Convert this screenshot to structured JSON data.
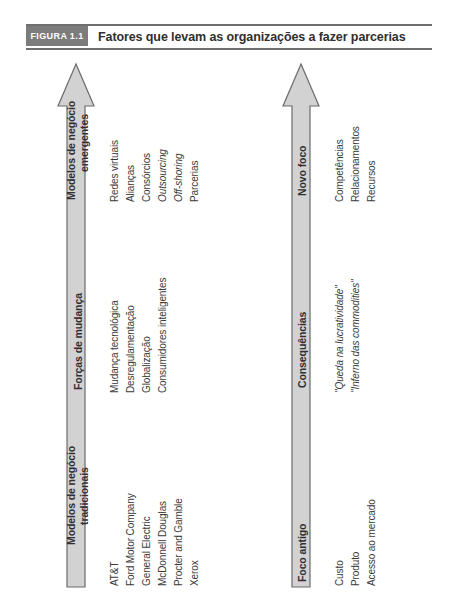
{
  "figure": {
    "badge": "FIGURA 1.1",
    "title": "Fatores que levam as organizações a fazer parcerias"
  },
  "colors": {
    "arrow_fill": "#d2d2d2",
    "arrow_stroke": "#6b6b6b",
    "badge_bg": "#7c7c7c",
    "rule": "#6f6f6f",
    "text": "#3a3a3a"
  },
  "left_arrow": {
    "name": "left-arrow",
    "bands": [
      {
        "label": "Modelos de negócio emergentes",
        "label_line1": "Modelos de negócio",
        "label_line2": "emergentes",
        "items": [
          {
            "text": "Redes virtuais",
            "italic": false
          },
          {
            "text": "Alianças",
            "italic": false
          },
          {
            "text": "Consórcios",
            "italic": false
          },
          {
            "text": "Outsourcing",
            "italic": true
          },
          {
            "text": "Off-shoring",
            "italic": true
          },
          {
            "text": "Parcerias",
            "italic": false
          }
        ]
      },
      {
        "label": "Forças de mudança",
        "label_line1": "Forças de mudança",
        "label_line2": "",
        "items": [
          {
            "text": "Mudança tecnológica",
            "italic": false
          },
          {
            "text": "Desregulamentação",
            "italic": false
          },
          {
            "text": "Globalização",
            "italic": false
          },
          {
            "text": "Consumidores inteligentes",
            "italic": false
          }
        ]
      },
      {
        "label": "Modelos de negócio tradicionais",
        "label_line1": "Modelos de negócio",
        "label_line2": "tradicionais",
        "items": [
          {
            "text": "AT&T",
            "italic": false
          },
          {
            "text": "Ford Motor Company",
            "italic": false
          },
          {
            "text": "General Electric",
            "italic": false
          },
          {
            "text": "McDonnell Douglas",
            "italic": false
          },
          {
            "text": "Procter and Gamble",
            "italic": false
          },
          {
            "text": "Xerox",
            "italic": false
          }
        ]
      }
    ]
  },
  "right_arrow": {
    "name": "right-arrow",
    "bands": [
      {
        "label": "Novo foco",
        "label_line1": "Novo foco",
        "label_line2": "",
        "items": [
          {
            "text": "Competências",
            "italic": false
          },
          {
            "text": "Relacionamentos",
            "italic": false
          },
          {
            "text": "Recursos",
            "italic": false
          }
        ]
      },
      {
        "label": "Consequências",
        "label_line1": "Consequências",
        "label_line2": "",
        "items": [
          {
            "text": "\"Queda na lucratividade\"",
            "italic": true
          },
          {
            "text": "\"Inferno das commodities\"",
            "italic": true
          }
        ]
      },
      {
        "label": "Foco antigo",
        "label_line1": "Foco antigo",
        "label_line2": "",
        "items": [
          {
            "text": "Custo",
            "italic": false
          },
          {
            "text": "Produto",
            "italic": false
          },
          {
            "text": "Acesso ao mercado",
            "italic": false
          }
        ]
      }
    ]
  }
}
